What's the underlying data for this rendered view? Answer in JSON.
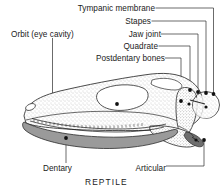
{
  "figure": {
    "caption": "REPTILE",
    "colors": {
      "ink": "#1a1a1a",
      "line": "#2b2b2b",
      "dentary_fill": "#9a9a9a",
      "bone_stipple": "#cfcfcf",
      "background": "#ffffff"
    }
  },
  "labels": [
    {
      "id": "tympanic-membrane",
      "text": "Tympanic membrane"
    },
    {
      "id": "stapes",
      "text": "Stapes"
    },
    {
      "id": "orbit",
      "text": "Orbit (eye cavity)"
    },
    {
      "id": "jaw-joint",
      "text": "Jaw joint"
    },
    {
      "id": "quadrate",
      "text": "Quadrate"
    },
    {
      "id": "postdentary-bones",
      "text": "Postdentary bones"
    },
    {
      "id": "dentary",
      "text": "Dentary"
    },
    {
      "id": "articular",
      "text": "Articular"
    }
  ]
}
